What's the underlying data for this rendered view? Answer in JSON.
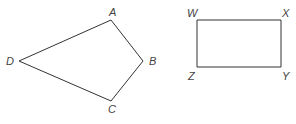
{
  "figures": [
    {
      "name": "quadrilateral-ABCD",
      "type": "kite",
      "vertices": [
        {
          "label": "A",
          "x": 111,
          "y": 20,
          "lx": 109,
          "ly": 16
        },
        {
          "label": "B",
          "x": 143,
          "y": 61,
          "lx": 149,
          "ly": 65
        },
        {
          "label": "C",
          "x": 111,
          "y": 101,
          "lx": 111,
          "ly": 113
        },
        {
          "label": "D",
          "x": 19,
          "y": 61,
          "lx": 9,
          "ly": 65
        }
      ]
    },
    {
      "name": "rectangle-WXYZ",
      "type": "rectangle",
      "vertices": [
        {
          "label": "W",
          "x": 197,
          "y": 20,
          "lx": 190,
          "ly": 17
        },
        {
          "label": "X",
          "x": 281,
          "y": 20,
          "lx": 285,
          "ly": 17
        },
        {
          "label": "Y",
          "x": 281,
          "y": 67,
          "lx": 285,
          "ly": 80
        },
        {
          "label": "Z",
          "x": 197,
          "y": 67,
          "lx": 191,
          "ly": 80
        }
      ]
    }
  ]
}
